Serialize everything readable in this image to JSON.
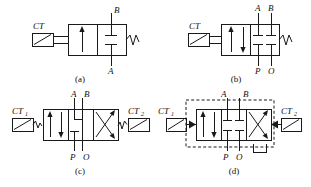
{
  "figure": {
    "background_color": "#ffffff",
    "line_color": "#1a1a1a",
    "panels": [
      {
        "id": "a",
        "caption": "(a)",
        "actuator_left_label": "CT",
        "actuator_left_sub": "",
        "actuator_right_label": "",
        "actuator_right_sub": "",
        "ports_top": [
          "B"
        ],
        "ports_bottom": [
          "A"
        ],
        "positions": 2,
        "left_element": "single-up-arrow",
        "right_element": "two-blocked-ports",
        "right_end": "spring",
        "dashed_enclosure": false,
        "drain_bracket": false
      },
      {
        "id": "b",
        "caption": "(b)",
        "actuator_left_label": "CT",
        "actuator_left_sub": "",
        "actuator_right_label": "",
        "actuator_right_sub": "",
        "ports_top": [
          "A",
          "B"
        ],
        "ports_bottom": [
          "P",
          "O"
        ],
        "positions": 2,
        "left_element": "up-down-arrows",
        "right_element": "four-blocked-ports",
        "right_end": "spring",
        "dashed_enclosure": false,
        "drain_bracket": false
      },
      {
        "id": "c",
        "caption": "(c)",
        "actuator_left_label": "CT",
        "actuator_left_sub": "1",
        "actuator_right_label": "CT",
        "actuator_right_sub": "2",
        "ports_top": [
          "A",
          "B"
        ],
        "ports_bottom": [
          "P",
          "O"
        ],
        "positions": 3,
        "left_element": "up-down-arrows",
        "center_element": "elbow-and-blocked",
        "right_element": "crossed-arrows",
        "left_end": "spring",
        "right_end": "spring",
        "dashed_enclosure": false,
        "drain_bracket": false
      },
      {
        "id": "d",
        "caption": "(d)",
        "actuator_left_label": "CT",
        "actuator_left_sub": "1",
        "actuator_right_label": "CT",
        "actuator_right_sub": "2",
        "ports_top": [
          "A",
          "B"
        ],
        "ports_bottom": [
          "P",
          "O"
        ],
        "positions": 3,
        "left_element": "up-down-arrows",
        "center_element": "four-blocked-ports",
        "right_element": "crossed-arrows",
        "left_end": "solid-triangle",
        "right_end": "solid-triangle",
        "dashed_enclosure": true,
        "drain_bracket": true
      }
    ]
  }
}
